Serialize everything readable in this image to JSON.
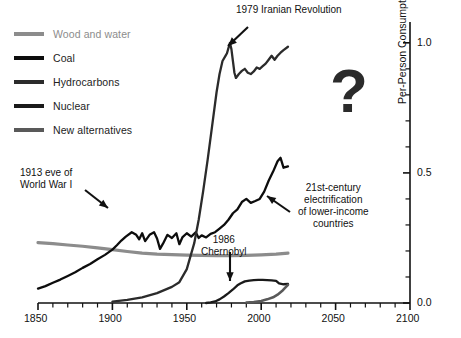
{
  "legend": {
    "items": [
      {
        "label": "Wood and water",
        "color": "#8c8c8c",
        "muted": true
      },
      {
        "label": "Coal",
        "color": "#0d0d0d",
        "muted": false
      },
      {
        "label": "Hydrocarbons",
        "color": "#2b2b2b",
        "muted": false
      },
      {
        "label": "Nuclear",
        "color": "#1a1a1a",
        "muted": false
      },
      {
        "label": "New alternatives",
        "color": "#595959",
        "muted": false
      }
    ]
  },
  "annotations": {
    "iran": "1979 Iranian Revolution",
    "ww1": "1913 eve of\nWorld War I",
    "chernobyl": "1986\nChernobyl",
    "electrification": "21st-century\nelectrification\nof lower-income\ncountries",
    "future_unknown": "?"
  },
  "axes": {
    "x_ticks": [
      "1850",
      "1900",
      "1950",
      "2000",
      "2050",
      "2100"
    ],
    "y_ticks": [
      "0.0",
      "0.5",
      "1.0"
    ],
    "ylabel": "Per-Person Consumption, toe"
  },
  "chart_data": {
    "type": "line",
    "title": "",
    "xlabel": "",
    "ylabel": "Per-Person Consumption, toe",
    "xlim": [
      1850,
      2100
    ],
    "ylim": [
      0.0,
      1.08
    ],
    "x_major_ticks": [
      1850,
      1900,
      1950,
      2000,
      2050,
      2100
    ],
    "x_minor_step": 10,
    "y_major_ticks": [
      0.0,
      0.5,
      1.0
    ],
    "y_minor_step": 0.1,
    "grid": false,
    "legend_position": "top-left",
    "axis_position": "y-right",
    "series": [
      {
        "name": "Wood and water",
        "color": "#8c8c8c",
        "width": 3.2,
        "x": [
          1850,
          1860,
          1870,
          1880,
          1890,
          1900,
          1910,
          1920,
          1930,
          1940,
          1950,
          1960,
          1970,
          1980,
          1990,
          2000,
          2010,
          2018
        ],
        "values": [
          0.232,
          0.228,
          0.223,
          0.218,
          0.212,
          0.205,
          0.198,
          0.192,
          0.188,
          0.186,
          0.184,
          0.183,
          0.182,
          0.182,
          0.183,
          0.185,
          0.188,
          0.192
        ]
      },
      {
        "name": "Coal",
        "color": "#0d0d0d",
        "width": 2.3,
        "x": [
          1850,
          1855,
          1860,
          1865,
          1870,
          1875,
          1880,
          1885,
          1890,
          1895,
          1900,
          1903,
          1906,
          1909,
          1913,
          1916,
          1918,
          1920,
          1922,
          1925,
          1928,
          1930,
          1932,
          1934,
          1937,
          1940,
          1943,
          1945,
          1947,
          1950,
          1953,
          1956,
          1958,
          1960,
          1963,
          1966,
          1969,
          1972,
          1975,
          1978,
          1981,
          1984,
          1987,
          1990,
          1993,
          1996,
          1999,
          2002,
          2005,
          2008,
          2011,
          2013,
          2015,
          2018
        ],
        "values": [
          0.055,
          0.065,
          0.078,
          0.09,
          0.104,
          0.118,
          0.135,
          0.15,
          0.168,
          0.185,
          0.205,
          0.222,
          0.24,
          0.255,
          0.272,
          0.262,
          0.245,
          0.268,
          0.238,
          0.262,
          0.272,
          0.248,
          0.208,
          0.228,
          0.262,
          0.25,
          0.268,
          0.226,
          0.252,
          0.268,
          0.255,
          0.272,
          0.25,
          0.26,
          0.252,
          0.266,
          0.272,
          0.286,
          0.3,
          0.32,
          0.345,
          0.36,
          0.388,
          0.4,
          0.385,
          0.392,
          0.4,
          0.428,
          0.47,
          0.505,
          0.545,
          0.558,
          0.52,
          0.525
        ]
      },
      {
        "name": "Hydrocarbons",
        "color": "#2b2b2b",
        "width": 2.3,
        "x": [
          1900,
          1910,
          1920,
          1930,
          1940,
          1945,
          1950,
          1955,
          1958,
          1961,
          1964,
          1967,
          1970,
          1972,
          1974,
          1976,
          1977,
          1979,
          1980,
          1981,
          1982,
          1983,
          1985,
          1987,
          1989,
          1991,
          1993,
          1995,
          1997,
          1999,
          2001,
          2003,
          2005,
          2007,
          2009,
          2011,
          2013,
          2015,
          2018
        ],
        "values": [
          0.005,
          0.012,
          0.022,
          0.038,
          0.062,
          0.08,
          0.13,
          0.23,
          0.32,
          0.43,
          0.55,
          0.68,
          0.81,
          0.88,
          0.93,
          0.95,
          0.96,
          1.0,
          0.975,
          0.93,
          0.885,
          0.865,
          0.88,
          0.892,
          0.9,
          0.885,
          0.88,
          0.89,
          0.905,
          0.9,
          0.91,
          0.92,
          0.935,
          0.95,
          0.935,
          0.95,
          0.962,
          0.972,
          0.985
        ]
      },
      {
        "name": "Nuclear",
        "color": "#1a1a1a",
        "width": 2.3,
        "x": [
          1963,
          1966,
          1969,
          1972,
          1975,
          1978,
          1981,
          1984,
          1986,
          1989,
          1992,
          1995,
          1998,
          2001,
          2004,
          2007,
          2010,
          2012,
          2015,
          2018
        ],
        "values": [
          0.0,
          0.002,
          0.006,
          0.014,
          0.025,
          0.038,
          0.052,
          0.068,
          0.075,
          0.083,
          0.086,
          0.088,
          0.089,
          0.089,
          0.088,
          0.087,
          0.085,
          0.075,
          0.072,
          0.073
        ]
      },
      {
        "name": "New alternatives",
        "color": "#595959",
        "width": 2.6,
        "x": [
          1990,
          1995,
          2000,
          2004,
          2008,
          2011,
          2014,
          2016,
          2018
        ],
        "values": [
          0.002,
          0.004,
          0.008,
          0.014,
          0.022,
          0.032,
          0.046,
          0.058,
          0.07
        ]
      }
    ],
    "annotations": [
      {
        "text": "1979 Iranian Revolution",
        "target_x": 1975,
        "target_y": 1.0
      },
      {
        "text": "1913 eve of World War I",
        "target_x": 1913,
        "target_y": 0.272
      },
      {
        "text": "1986 Chernobyl",
        "target_x": 1986,
        "target_y": 0.08
      },
      {
        "text": "21st-century electrification of lower-income countries",
        "target_x": 2012,
        "target_y": 0.555
      },
      {
        "text": "?",
        "target_x": 2050,
        "target_y": 0.82
      }
    ]
  }
}
